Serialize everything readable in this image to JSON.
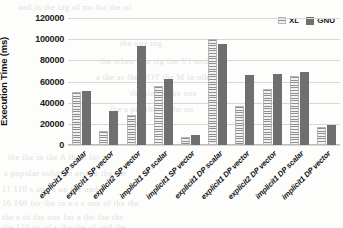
{
  "chart_data": {
    "type": "bar",
    "title": "",
    "xlabel": "",
    "ylabel": "Execution Time (ms)",
    "ylim": [
      0,
      120000
    ],
    "ytick_step": 20000,
    "yticks": [
      "120000",
      "100000",
      "80000",
      "60000",
      "40000",
      "20000",
      "0"
    ],
    "grid": true,
    "legend_position": "top-right",
    "categories": [
      "explicit1 SP scalar",
      "explicit1 SP vector",
      "explicit2 SP vector",
      "implicit1 SP scalar",
      "implicit1 SP vector",
      "explicit1 DP scalar",
      "explicit1 DP vector",
      "explicit2 DP vector",
      "implicit1 DP scalar",
      "implicit1 DP vector"
    ],
    "series": [
      {
        "name": "XL",
        "color": "#8f8f8f",
        "pattern": "horizontal-hatch",
        "values": [
          50000,
          13500,
          28000,
          55500,
          8000,
          100000,
          36500,
          52500,
          65000,
          17000
        ]
      },
      {
        "name": "GNU",
        "color": "#6f6f6f",
        "pattern": "solid",
        "values": [
          51000,
          32500,
          94000,
          62000,
          9800,
          95500,
          66000,
          67000,
          69000,
          18500
        ]
      }
    ]
  },
  "background_text": {
    "lines": [
      "and in  the   tag    of      ms      for     the      of",
      "the        one        ing",
      "the      when     in    a          sig      the        V1      and",
      "a        the      as      the     NOT      the M     in        other",
      "the         sin         on       the                   one",
      "the     a        per        the         of        the        on",
      "the     the         in      the   A      the      a      for      is",
      "a  popular          solution  and  in          the  the",
      "11 110        s      and  a        on              the     and  a",
      "16 160    for      the     in   a    s   s   one  of  the  the",
      "the    a   of     the    one  for       a   the   the   the",
      "the  110      an  of   s  the      the     of   and   the"
    ]
  }
}
